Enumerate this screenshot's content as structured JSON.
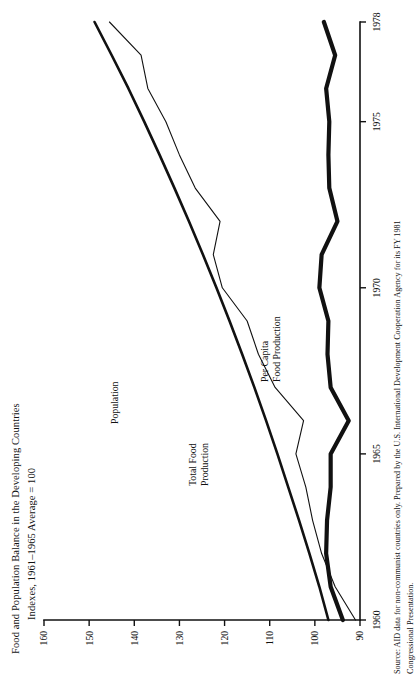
{
  "figure": {
    "title_line1": "Food and Population Balance in the Developing Countries",
    "title_line2": "Indexes, 1961–1965 Average = 100",
    "source_line1": "Source: AID data for non-communist countries only. Prepared by the U.S. International Development Cooperation Agency for its FY 1981",
    "source_line2": "Congressional Presentation."
  },
  "chart_data": {
    "type": "line",
    "title": "Food and Population Balance in the Developing Countries",
    "subtitle": "Indexes, 1961–1965 Average = 100",
    "xlabel": "",
    "ylabel": "",
    "xlim": [
      1960,
      1978
    ],
    "ylim": [
      90,
      160
    ],
    "xticks": [
      1960,
      1965,
      1970,
      1975,
      1978
    ],
    "xtick_labels": [
      "1960",
      "1965",
      "1970",
      "1975",
      "1978"
    ],
    "yticks": [
      90,
      100,
      110,
      120,
      130,
      140,
      150,
      160
    ],
    "ytick_labels": [
      "90",
      "100",
      "110",
      "120",
      "130",
      "140",
      "150",
      "160"
    ],
    "grid": false,
    "legend": "inline-labels",
    "x": [
      1960,
      1961,
      1962,
      1963,
      1964,
      1965,
      1966,
      1967,
      1968,
      1969,
      1970,
      1971,
      1972,
      1973,
      1974,
      1975,
      1976,
      1977,
      1978
    ],
    "series": [
      {
        "name": "Population",
        "label": "Population",
        "style": "medium",
        "values": [
          97.0,
          99.0,
          101.2,
          103.5,
          105.9,
          108.3,
          110.8,
          113.4,
          116.1,
          118.9,
          121.8,
          124.8,
          127.9,
          131.1,
          134.4,
          137.8,
          141.3,
          145.0,
          148.8
        ]
      },
      {
        "name": "Total Food Production",
        "label": "Total Food\nProduction",
        "style": "thin",
        "values": [
          91.0,
          95.5,
          98.5,
          100.5,
          102.0,
          104.2,
          102.5,
          108.8,
          112.5,
          115.0,
          120.5,
          122.5,
          121.0,
          126.5,
          130.0,
          133.0,
          137.0,
          138.5,
          145.5
        ]
      },
      {
        "name": "Per Capita Food Production",
        "label": "Per Capita\nFood Production",
        "style": "thick",
        "values": [
          93.8,
          96.5,
          97.5,
          97.3,
          96.5,
          96.5,
          92.5,
          96.5,
          97.2,
          97.0,
          99.0,
          98.5,
          95.0,
          96.8,
          97.0,
          96.8,
          97.5,
          95.5,
          98.0
        ]
      }
    ],
    "annotations": [
      {
        "text": "Population",
        "near_series": "Population"
      },
      {
        "text": "Total Food Production",
        "near_series": "Total Food Production"
      },
      {
        "text": "Per Capita Food Production",
        "near_series": "Per Capita Food Production"
      }
    ]
  }
}
